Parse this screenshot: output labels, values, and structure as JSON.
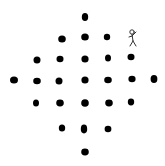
{
  "diagram": {
    "background": "#ffffff",
    "dot_color": "#000000",
    "figure_color": "#333333",
    "dots": [
      {
        "x": 85,
        "y": 17,
        "rx": 3.2,
        "ry": 4.0
      },
      {
        "x": 62,
        "y": 39,
        "rx": 3.8,
        "ry": 3.6
      },
      {
        "x": 85,
        "y": 37,
        "rx": 3.8,
        "ry": 3.6
      },
      {
        "x": 107,
        "y": 37,
        "rx": 3.2,
        "ry": 3.2
      },
      {
        "x": 37,
        "y": 60,
        "rx": 3.5,
        "ry": 3.5
      },
      {
        "x": 60,
        "y": 59,
        "rx": 3.5,
        "ry": 3.2
      },
      {
        "x": 85,
        "y": 59,
        "rx": 3.6,
        "ry": 3.6
      },
      {
        "x": 108,
        "y": 58,
        "rx": 3.0,
        "ry": 3.6
      },
      {
        "x": 131,
        "y": 57,
        "rx": 3.5,
        "ry": 3.2
      },
      {
        "x": 14,
        "y": 80,
        "rx": 4.0,
        "ry": 3.6
      },
      {
        "x": 37,
        "y": 81,
        "rx": 3.8,
        "ry": 3.2
      },
      {
        "x": 59,
        "y": 81,
        "rx": 3.5,
        "ry": 3.5
      },
      {
        "x": 85,
        "y": 80,
        "rx": 3.6,
        "ry": 3.6
      },
      {
        "x": 108,
        "y": 80,
        "rx": 3.8,
        "ry": 3.2
      },
      {
        "x": 132,
        "y": 79,
        "rx": 3.6,
        "ry": 3.2
      },
      {
        "x": 154,
        "y": 79,
        "rx": 3.4,
        "ry": 4.0
      },
      {
        "x": 36,
        "y": 103,
        "rx": 3.0,
        "ry": 3.6
      },
      {
        "x": 60,
        "y": 103,
        "rx": 3.8,
        "ry": 3.4
      },
      {
        "x": 85,
        "y": 103,
        "rx": 3.8,
        "ry": 3.8
      },
      {
        "x": 109,
        "y": 103,
        "rx": 3.8,
        "ry": 3.4
      },
      {
        "x": 131,
        "y": 102,
        "rx": 3.2,
        "ry": 3.4
      },
      {
        "x": 62,
        "y": 128,
        "rx": 3.2,
        "ry": 3.6
      },
      {
        "x": 84,
        "y": 129,
        "rx": 3.2,
        "ry": 4.4
      },
      {
        "x": 108,
        "y": 129,
        "rx": 3.4,
        "ry": 3.2
      },
      {
        "x": 85,
        "y": 152,
        "rx": 3.8,
        "ry": 3.4
      }
    ],
    "stick_figure": {
      "x": 133,
      "y": 38,
      "pose": "one-arm-raised"
    }
  }
}
